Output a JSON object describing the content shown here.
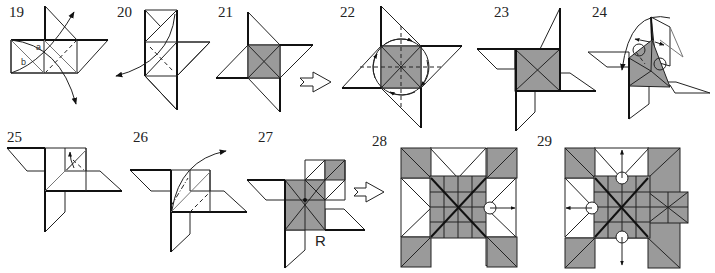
{
  "diagram": {
    "type": "origami-folding-sequence",
    "colors": {
      "line": "#222222",
      "shaded": "#9a9a9a",
      "background": "#ffffff"
    },
    "steps": [
      {
        "number": "19",
        "labels": [
          "a",
          "b"
        ],
        "arrows": [
          "fold-up",
          "fold-down"
        ]
      },
      {
        "number": "20",
        "arrows": [
          "fold-left"
        ]
      },
      {
        "number": "21"
      },
      {
        "number": "22",
        "arrows": [
          "rotate-circle"
        ]
      },
      {
        "number": "23"
      },
      {
        "number": "24",
        "arrows": [
          "swing-over"
        ],
        "markers": [
          "circle",
          "circle"
        ]
      },
      {
        "number": "25",
        "arrows": [
          "fold-up"
        ]
      },
      {
        "number": "26",
        "arrows": [
          "unfold-right"
        ]
      },
      {
        "number": "27",
        "labels": [
          "R"
        ]
      },
      {
        "number": "28",
        "arrows": [
          "pull-right"
        ],
        "markers": [
          "circle"
        ]
      },
      {
        "number": "29",
        "arrows": [
          "pull-up",
          "pull-left",
          "pull-down"
        ],
        "markers": [
          "circle",
          "circle",
          "circle"
        ]
      }
    ],
    "transition_arrows": [
      "21-to-22",
      "27-to-28"
    ]
  }
}
